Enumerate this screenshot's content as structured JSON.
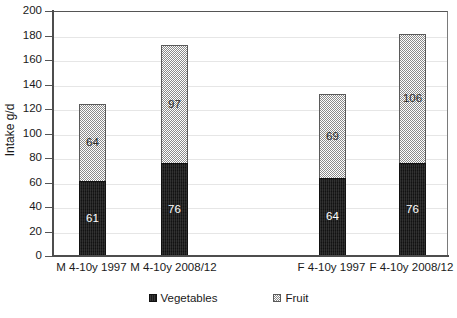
{
  "chart_data": {
    "type": "bar",
    "subtype": "stacked-vertical",
    "title": "",
    "xlabel": "",
    "ylabel": "Intake  g/d",
    "ylim": [
      0,
      200
    ],
    "ytick_step": 20,
    "yticks": [
      200,
      180,
      160,
      140,
      120,
      100,
      80,
      60,
      40,
      20,
      0
    ],
    "ytick_labels": [
      "200",
      "180",
      "160",
      "140",
      "120",
      "100",
      "80",
      "60",
      "40",
      "20",
      "0"
    ],
    "grid": "horizontal",
    "legend_position": "bottom",
    "categories": [
      "M 4-10y 1997",
      "M 4-10y 2008/12",
      "F 4-10y 1997",
      "F 4-10y 2008/12"
    ],
    "series": [
      {
        "name": "Vegetables",
        "color": "#1b1b1b",
        "pattern": "solid-dark",
        "values": [
          61,
          76,
          64,
          76
        ],
        "labels": [
          "61",
          "76",
          "64",
          "76"
        ]
      },
      {
        "name": "Fruit",
        "color": "#8a8a8a",
        "pattern": "checkerboard",
        "values": [
          64,
          97,
          69,
          106
        ],
        "labels": [
          "64",
          "97",
          "69",
          "106"
        ]
      }
    ],
    "totals": [
      125,
      173,
      133,
      182
    ]
  },
  "legend": {
    "items": [
      {
        "label": "Vegetables",
        "swatch": "veg-swatch-icon"
      },
      {
        "label": "Fruit",
        "swatch": "fruit-swatch-icon"
      }
    ]
  }
}
